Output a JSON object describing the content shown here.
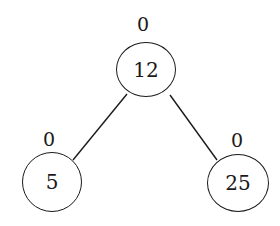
{
  "diagram": {
    "type": "binary-tree",
    "colors": {
      "stroke": "#1a1a1a",
      "background": "#ffffff",
      "text": "#1a1a1a"
    },
    "nodes": [
      {
        "id": "root",
        "value": "12",
        "label": "0"
      },
      {
        "id": "left",
        "value": "5",
        "label": "0"
      },
      {
        "id": "right",
        "value": "25",
        "label": "0"
      }
    ],
    "edges": [
      {
        "from": "root",
        "to": "left"
      },
      {
        "from": "root",
        "to": "right"
      }
    ]
  }
}
